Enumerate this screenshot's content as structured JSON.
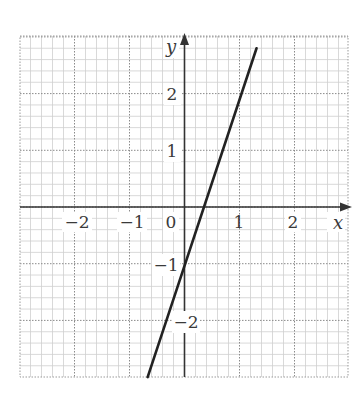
{
  "chart_data": {
    "type": "line",
    "title": "",
    "xlabel": "x",
    "ylabel": "y",
    "xlim": [
      -3,
      2.9
    ],
    "ylim": [
      -3,
      3
    ],
    "grid": true,
    "major_step": 1,
    "minor_step": 0.2,
    "x_ticks": [
      {
        "value": -2,
        "label": "−2"
      },
      {
        "value": -1,
        "label": "−1"
      },
      {
        "value": 0,
        "label": "0"
      },
      {
        "value": 1,
        "label": "1"
      },
      {
        "value": 2,
        "label": "2"
      }
    ],
    "y_ticks": [
      {
        "value": 2,
        "label": "2"
      },
      {
        "value": 1,
        "label": "1"
      },
      {
        "value": -1,
        "label": "−1"
      },
      {
        "value": -2,
        "label": "−2"
      }
    ],
    "series": [
      {
        "name": "y = 3x − 1",
        "equation": "y = 3x - 1",
        "slope": 3,
        "intercept": -1,
        "x": [
          -0.67,
          1.31
        ],
        "y": [
          -3.0,
          2.8
        ],
        "points_on_line": [
          {
            "x": 0,
            "y": -1
          },
          {
            "x": 1,
            "y": 2
          },
          {
            "x": 0.33,
            "y": 0
          }
        ]
      }
    ]
  },
  "labels": {
    "x_axis": "x",
    "y_axis": "y",
    "x_ticks": [
      "−2",
      "−1",
      "0",
      "1",
      "2"
    ],
    "y_ticks": [
      "2",
      "1",
      "−1",
      "−2"
    ]
  }
}
